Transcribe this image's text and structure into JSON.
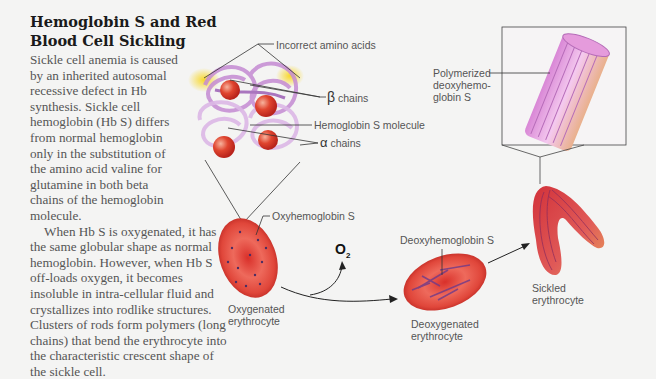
{
  "title": "Hemoglobin S and Red Blood Cell Sickling",
  "paragraphs": [
    "Sickle cell anemia is caused by an inherited autosomal recessive defect in Hb synthesis. Sickle cell hemoglobin (Hb S) differs from normal hemoglobin only in the substitution of the amino acid valine for glutamine in both beta chains of the hemoglobin molecule.",
    "When Hb S is oxygenated, it has the same globular shape as normal hemoglobin. However, when Hb S off-loads oxygen, it becomes insoluble in intra-cellular fluid and crystallizes into rodlike structures. Clusters of rods form polymers (long chains) that bend the erythrocyte into the characteristic crescent shape of the sickle cell."
  ],
  "labels": {
    "incorrect_amino_acids": "Incorrect amino acids",
    "beta_symbol": "β",
    "beta_chains": "chains",
    "hemoglobin_s_molecule": "Hemoglobin S molecule",
    "alpha_symbol": "α",
    "alpha_chains": "chains",
    "oxyhemoglobin_s": "Oxyhemoglobin S",
    "oxygenated_erythrocyte_1": "Oxygenated",
    "oxygenated_erythrocyte_2": "erythrocyte",
    "o2_main": "O",
    "o2_sub": "2",
    "deoxyhemoglobin_s": "Deoxyhemoglobin S",
    "deoxygenated_erythrocyte_1": "Deoxygenated",
    "deoxygenated_erythrocyte_2": "erythrocyte",
    "polymerized_1": "Polymerized",
    "polymerized_2": "deoxyhemo-",
    "polymerized_3": "globin S",
    "sickled_erythrocyte_1": "Sickled",
    "sickled_erythrocyte_2": "erythrocyte"
  },
  "colors": {
    "rbc_red": "#d8342a",
    "chain_purple": "#b77cc6",
    "heme_red": "#d9412e",
    "polymer_pink": "#e6a3e0",
    "highlight_yellow": "#f6d02a"
  }
}
